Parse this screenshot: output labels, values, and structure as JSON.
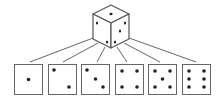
{
  "diagram": {
    "title": "",
    "colors": {
      "stroke": "#555555",
      "pip": "#222222",
      "background": "#ffffff"
    },
    "cube": {
      "top_face_pips": 1,
      "left_face_pips": 2,
      "right_face_pips": 3
    },
    "faces": [
      {
        "value": 1,
        "label": "one"
      },
      {
        "value": 2,
        "label": "two"
      },
      {
        "value": 3,
        "label": "three"
      },
      {
        "value": 4,
        "label": "four"
      },
      {
        "value": 5,
        "label": "five"
      },
      {
        "value": 6,
        "label": "six"
      }
    ]
  }
}
